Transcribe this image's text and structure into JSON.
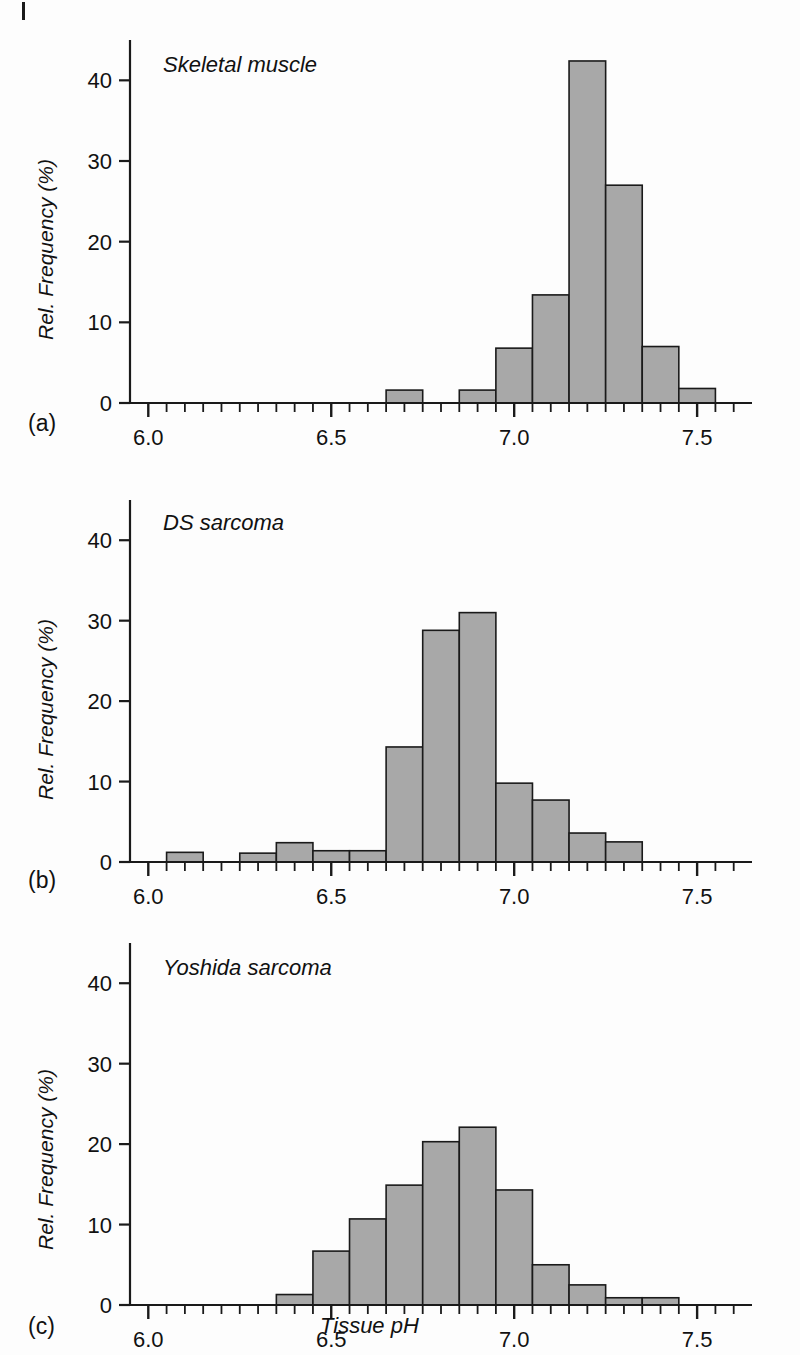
{
  "figure": {
    "xlabel": "Tissue pH",
    "ylabel": "Rel. Frequency (%)",
    "panel_tags": [
      "(a)",
      "(b)",
      "(c)"
    ]
  },
  "axis": {
    "x_ticklabels": [
      "6.0",
      "6.5",
      "7.0",
      "7.5"
    ],
    "x_tickvalues": [
      6.0,
      6.5,
      7.0,
      7.5
    ],
    "y_ticklabels": [
      "0",
      "10",
      "20",
      "30",
      "40"
    ],
    "y_tickvalues": [
      0,
      10,
      20,
      30,
      40
    ],
    "x_minor_step": 0.05,
    "xlim": [
      5.95,
      7.65
    ],
    "ylim": [
      0,
      45
    ]
  },
  "style": {
    "bar_fill": "#a8a8a8",
    "bar_stroke": "#1a1a1a",
    "axis_color": "#1a1a1a",
    "background": "#fdfdfd"
  },
  "chart_data": [
    {
      "type": "bar",
      "title": "Skeletal muscle",
      "panel": "(a)",
      "xlabel": "Tissue pH",
      "ylabel": "Rel. Frequency (%)",
      "xlim": [
        5.95,
        7.65
      ],
      "ylim": [
        0,
        45
      ],
      "bin_width": 0.05,
      "grid": false,
      "bins": [
        {
          "x0": 6.65,
          "x1": 6.75,
          "value": 1.6
        },
        {
          "x0": 6.85,
          "x1": 6.95,
          "value": 1.6
        },
        {
          "x0": 6.95,
          "x1": 7.05,
          "value": 6.8
        },
        {
          "x0": 7.05,
          "x1": 7.15,
          "value": 13.4
        },
        {
          "x0": 7.15,
          "x1": 7.25,
          "value": 42.4
        },
        {
          "x0": 7.25,
          "x1": 7.35,
          "value": 27.0
        },
        {
          "x0": 7.35,
          "x1": 7.45,
          "value": 7.0
        },
        {
          "x0": 7.45,
          "x1": 7.55,
          "value": 1.8
        }
      ]
    },
    {
      "type": "bar",
      "title": "DS sarcoma",
      "panel": "(b)",
      "xlabel": "Tissue pH",
      "ylabel": "Rel. Frequency (%)",
      "xlim": [
        5.95,
        7.65
      ],
      "ylim": [
        0,
        45
      ],
      "bin_width": 0.05,
      "grid": false,
      "bins": [
        {
          "x0": 6.05,
          "x1": 6.15,
          "value": 1.2
        },
        {
          "x0": 6.25,
          "x1": 6.35,
          "value": 1.1
        },
        {
          "x0": 6.35,
          "x1": 6.45,
          "value": 2.4
        },
        {
          "x0": 6.45,
          "x1": 6.55,
          "value": 1.4
        },
        {
          "x0": 6.55,
          "x1": 6.65,
          "value": 1.4
        },
        {
          "x0": 6.65,
          "x1": 6.75,
          "value": 14.3
        },
        {
          "x0": 6.75,
          "x1": 6.85,
          "value": 28.8
        },
        {
          "x0": 6.85,
          "x1": 6.95,
          "value": 31.0
        },
        {
          "x0": 6.95,
          "x1": 7.05,
          "value": 9.8
        },
        {
          "x0": 7.05,
          "x1": 7.15,
          "value": 7.7
        },
        {
          "x0": 7.15,
          "x1": 7.25,
          "value": 3.6
        },
        {
          "x0": 7.25,
          "x1": 7.35,
          "value": 2.5
        }
      ]
    },
    {
      "type": "bar",
      "title": "Yoshida sarcoma",
      "panel": "(c)",
      "xlabel": "Tissue pH",
      "ylabel": "Rel. Frequency (%)",
      "xlim": [
        5.95,
        7.65
      ],
      "ylim": [
        0,
        45
      ],
      "bin_width": 0.05,
      "grid": false,
      "bins": [
        {
          "x0": 6.35,
          "x1": 6.45,
          "value": 1.3
        },
        {
          "x0": 6.45,
          "x1": 6.55,
          "value": 6.7
        },
        {
          "x0": 6.55,
          "x1": 6.65,
          "value": 10.7
        },
        {
          "x0": 6.65,
          "x1": 6.75,
          "value": 14.9
        },
        {
          "x0": 6.75,
          "x1": 6.85,
          "value": 20.3
        },
        {
          "x0": 6.85,
          "x1": 6.95,
          "value": 22.1
        },
        {
          "x0": 6.95,
          "x1": 7.05,
          "value": 14.3
        },
        {
          "x0": 7.05,
          "x1": 7.15,
          "value": 5.0
        },
        {
          "x0": 7.15,
          "x1": 7.25,
          "value": 2.5
        },
        {
          "x0": 7.25,
          "x1": 7.35,
          "value": 0.9
        },
        {
          "x0": 7.35,
          "x1": 7.45,
          "value": 0.9
        }
      ]
    }
  ]
}
